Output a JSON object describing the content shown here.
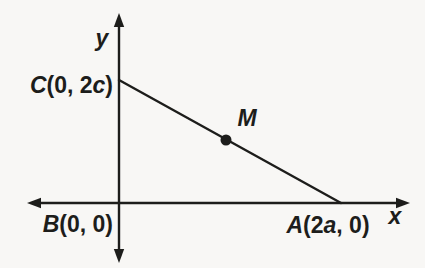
{
  "figure": {
    "type": "coordinate-geometry-diagram",
    "colors": {
      "paper": "#f8f7f5",
      "ink": "#1d1d1b"
    },
    "axes": {
      "x_label": "x",
      "y_label": "y"
    },
    "point_labels": {
      "C": {
        "text": "C(0, 2c)",
        "segments": [
          {
            "t": "C",
            "italic": true
          },
          {
            "t": "(0, 2",
            "italic": false
          },
          {
            "t": "c",
            "italic": true
          },
          {
            "t": ")",
            "italic": false
          }
        ]
      },
      "B": {
        "text": "B(0, 0)",
        "segments": [
          {
            "t": "B",
            "italic": true
          },
          {
            "t": "(0, 0)",
            "italic": false
          }
        ]
      },
      "A": {
        "text": "A(2a, 0)",
        "segments": [
          {
            "t": "A",
            "italic": true
          },
          {
            "t": "(2",
            "italic": false
          },
          {
            "t": "a",
            "italic": true
          },
          {
            "t": ", 0)",
            "italic": false
          }
        ]
      },
      "M": {
        "text": "M"
      }
    }
  }
}
